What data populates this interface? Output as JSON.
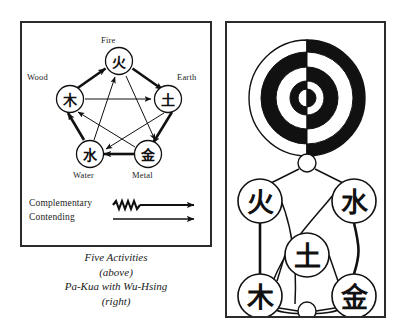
{
  "figure": {
    "caption_lines": [
      "Five Activities",
      "(above)",
      "Pa-Kua with Wu-Hsing",
      "(right)"
    ]
  },
  "wu_xing": {
    "title": "Five Activities",
    "nodes": [
      {
        "id": "fire",
        "label": "Fire",
        "glyph": "火",
        "cx": 97,
        "cy": 38
      },
      {
        "id": "wood",
        "label": "Wood",
        "glyph": "木",
        "cx": 48,
        "cy": 76
      },
      {
        "id": "earth",
        "label": "Earth",
        "glyph": "土",
        "cx": 146,
        "cy": 76
      },
      {
        "id": "water",
        "label": "Water",
        "glyph": "水",
        "cx": 68,
        "cy": 131
      },
      {
        "id": "metal",
        "label": "Metal",
        "glyph": "金",
        "cx": 126,
        "cy": 131
      }
    ],
    "complementary_cycle": [
      "wood",
      "fire",
      "earth",
      "metal",
      "water"
    ],
    "contending_cycle": [
      "wood",
      "earth",
      "water",
      "fire",
      "metal"
    ],
    "legend": [
      {
        "id": "complementary",
        "label": "Complementary",
        "arrow": "zigzag-arrow"
      },
      {
        "id": "contending",
        "label": "Contending",
        "arrow": "plain-arrow"
      }
    ]
  },
  "pa_kua": {
    "title": "Pa-Kua with Wu-Hsing",
    "taiji_rings": {
      "cx": 80,
      "cy": 75,
      "radii": [
        58,
        46,
        31,
        17,
        9
      ],
      "left_fills": [
        "#ffffff",
        "#111111",
        "#ffffff",
        "#111111",
        "#ffffff"
      ],
      "right_fills": [
        "#111111",
        "#ffffff",
        "#111111",
        "#ffffff",
        "#111111"
      ]
    },
    "nodes": [
      {
        "id": "top-hub",
        "glyph": "",
        "cx": 80,
        "cy": 140,
        "r": 9
      },
      {
        "id": "fire",
        "glyph": "火",
        "cx": 33,
        "cy": 178,
        "r": 22
      },
      {
        "id": "water",
        "glyph": "水",
        "cx": 127,
        "cy": 178,
        "r": 22
      },
      {
        "id": "earth",
        "glyph": "土",
        "cx": 80,
        "cy": 232,
        "r": 22
      },
      {
        "id": "wood",
        "glyph": "木",
        "cx": 33,
        "cy": 273,
        "r": 22
      },
      {
        "id": "metal",
        "glyph": "金",
        "cx": 127,
        "cy": 273,
        "r": 22
      },
      {
        "id": "bottom-hub",
        "glyph": "",
        "cx": 80,
        "cy": 288,
        "r": 9
      }
    ]
  },
  "colors": {
    "ink": "#111111",
    "border": "#2b2b2b",
    "paper": "#ffffff"
  }
}
